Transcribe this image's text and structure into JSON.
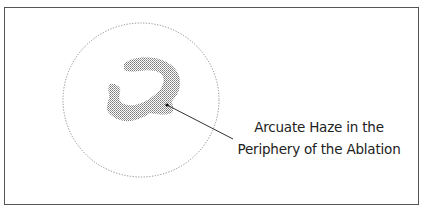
{
  "diagram": {
    "annotation": {
      "line1": "Arcuate Haze in the",
      "line2": "Periphery of the Ablation"
    },
    "elements": [
      "ablation-zone-dotted-circle",
      "arcuate-haze-stippled-region",
      "leader-line-with-dot"
    ],
    "colors": {
      "frame": "#555555",
      "circle": "#8a8a8a",
      "haze": "#9a9a9a",
      "leader": "#333333"
    }
  }
}
